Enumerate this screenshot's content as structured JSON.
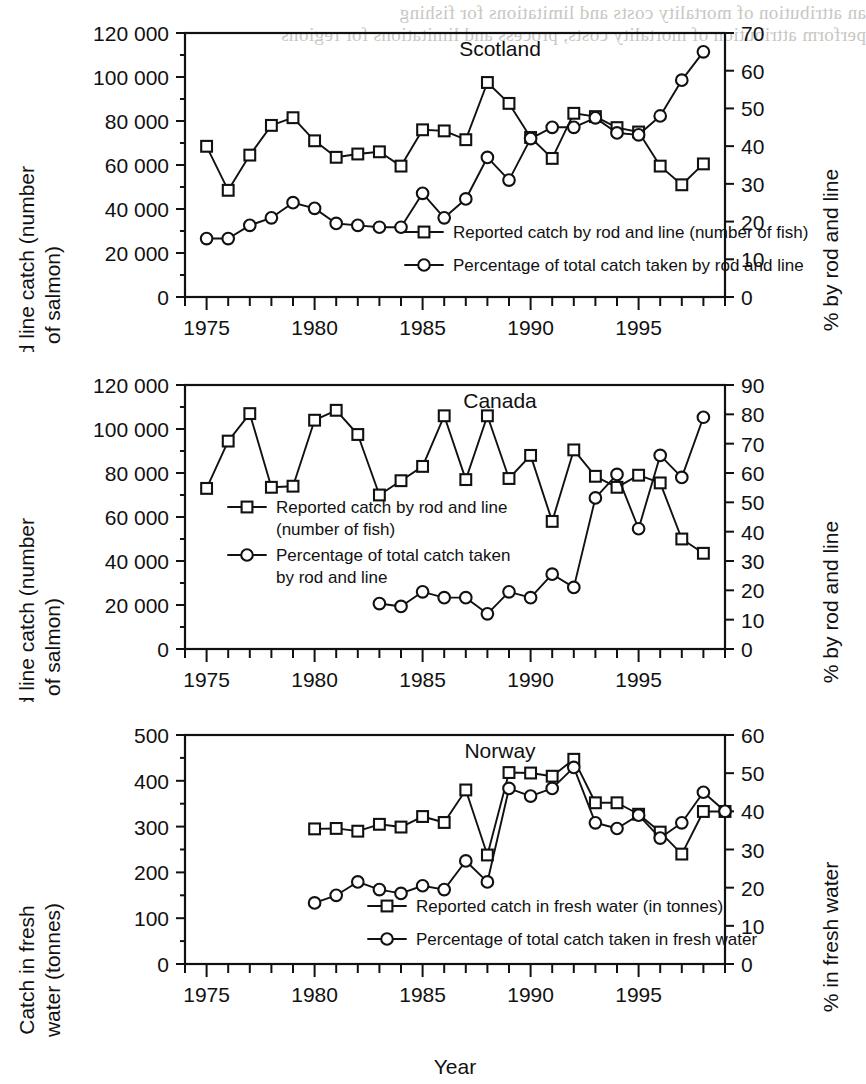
{
  "page": {
    "background_color": "#ffffff",
    "ink_color": "#111111",
    "showthrough_color": "#c9c6c2",
    "showthrough_lines": [
      "an attribution of mortality costs and limitations for fishing",
      "perform attribution of mortality costs, process and limitations for regions"
    ],
    "x_axis_title": "Year"
  },
  "chart_data": [
    {
      "id": "scotland",
      "type": "line",
      "title": "Scotland",
      "xlabel": "",
      "ylabel": "Rod and line catch (number of salmon)",
      "y2label": "% by rod and line",
      "xlim": [
        1974,
        1999
      ],
      "xticks": [
        1975,
        1980,
        1985,
        1990,
        1995
      ],
      "xtick_labels": [
        "1975",
        "1980",
        "1985",
        "1990",
        "1995"
      ],
      "ylim": [
        0,
        120000
      ],
      "yticks": [
        0,
        20000,
        40000,
        60000,
        80000,
        100000,
        120000
      ],
      "ytick_labels": [
        "0",
        "20 000",
        "40 000",
        "60 000",
        "80 000",
        "100 000",
        "120 000"
      ],
      "y2lim": [
        0,
        70
      ],
      "y2ticks": [
        0,
        10,
        20,
        30,
        40,
        50,
        60,
        70
      ],
      "y2tick_labels": [
        "0",
        "10",
        "20",
        "30",
        "40",
        "50",
        "60",
        "70"
      ],
      "grid": false,
      "legend_position": "lower-right-inside",
      "series": [
        {
          "name": "Reported catch by rod and line (number of fish)",
          "marker": "square",
          "axis": "left",
          "x": [
            1975,
            1976,
            1977,
            1978,
            1979,
            1980,
            1981,
            1982,
            1983,
            1984,
            1985,
            1986,
            1987,
            1988,
            1989,
            1990,
            1991,
            1992,
            1993,
            1994,
            1995,
            1996,
            1997,
            1998
          ],
          "values": [
            68500,
            48500,
            64500,
            78000,
            81500,
            71000,
            63500,
            65000,
            66000,
            59500,
            76000,
            75500,
            71500,
            97500,
            88000,
            72500,
            63000,
            83500,
            82000,
            77000,
            75000,
            59500,
            51000,
            60500
          ]
        },
        {
          "name": "Percentage of total catch taken by rod and line",
          "marker": "circle",
          "axis": "right",
          "x": [
            1975,
            1976,
            1977,
            1978,
            1979,
            1980,
            1981,
            1982,
            1983,
            1984,
            1985,
            1986,
            1987,
            1988,
            1989,
            1990,
            1991,
            1992,
            1993,
            1994,
            1995,
            1996,
            1997,
            1998
          ],
          "values": [
            15.5,
            15.5,
            19,
            21,
            25,
            23.5,
            19.5,
            19,
            18.5,
            18.5,
            27.5,
            21,
            26,
            37,
            31,
            42,
            45,
            45,
            47.5,
            43.5,
            43,
            48,
            57.5,
            65
          ]
        }
      ]
    },
    {
      "id": "canada",
      "type": "line",
      "title": "Canada",
      "xlabel": "",
      "ylabel": "Rod and line catch (number of salmon)",
      "y2label": "% by rod and line",
      "xlim": [
        1974,
        1999
      ],
      "xticks": [
        1975,
        1980,
        1985,
        1990,
        1995
      ],
      "xtick_labels": [
        "1975",
        "1980",
        "1985",
        "1990",
        "1995"
      ],
      "ylim": [
        0,
        120000
      ],
      "yticks": [
        0,
        20000,
        40000,
        60000,
        80000,
        100000,
        120000
      ],
      "ytick_labels": [
        "0",
        "20 000",
        "40 000",
        "60 000",
        "80 000",
        "100 000",
        "120 000"
      ],
      "y2lim": [
        0,
        90
      ],
      "y2ticks": [
        0,
        10,
        20,
        30,
        40,
        50,
        60,
        70,
        80,
        90
      ],
      "y2tick_labels": [
        "0",
        "10",
        "20",
        "30",
        "40",
        "50",
        "60",
        "70",
        "80",
        "90"
      ],
      "grid": false,
      "legend_position": "middle-left-inside",
      "series": [
        {
          "name": "Reported catch by rod and line (number of fish)",
          "marker": "square",
          "axis": "left",
          "x": [
            1975,
            1976,
            1977,
            1978,
            1979,
            1980,
            1981,
            1982,
            1983,
            1984,
            1985,
            1986,
            1987,
            1988,
            1989,
            1990,
            1991,
            1992,
            1993,
            1994,
            1995,
            1996,
            1997,
            1998
          ],
          "values": [
            73000,
            94500,
            107000,
            73500,
            74000,
            104000,
            108500,
            97500,
            70000,
            76500,
            83000,
            106000,
            77000,
            106000,
            77500,
            88000,
            58000,
            90500,
            78500,
            73500,
            79000,
            75500,
            50000,
            43500
          ]
        },
        {
          "name": "Percentage of total catch taken by rod and line",
          "marker": "circle",
          "axis": "right",
          "x": [
            1983,
            1984,
            1985,
            1986,
            1987,
            1988,
            1989,
            1990,
            1991,
            1992,
            1993,
            1994,
            1995,
            1996,
            1997,
            1998
          ],
          "values": [
            15.5,
            14.5,
            19.5,
            17.5,
            17.5,
            12,
            19.5,
            17.5,
            25.5,
            21,
            51.5,
            59.5,
            41,
            66,
            58.5,
            79,
            77
          ]
        }
      ]
    },
    {
      "id": "norway",
      "type": "line",
      "title": "Norway",
      "xlabel": "Year",
      "ylabel": "Catch in fresh water (tonnes)",
      "y2label": "% in fresh water",
      "xlim": [
        1974,
        1999
      ],
      "xticks": [
        1975,
        1980,
        1985,
        1990,
        1995
      ],
      "xtick_labels": [
        "1975",
        "1980",
        "1985",
        "1990",
        "1995"
      ],
      "ylim": [
        0,
        500
      ],
      "yticks": [
        0,
        100,
        200,
        300,
        400,
        500
      ],
      "ytick_labels": [
        "0",
        "100",
        "200",
        "300",
        "400",
        "500"
      ],
      "y2lim": [
        0,
        60
      ],
      "y2ticks": [
        0,
        10,
        20,
        30,
        40,
        50,
        60
      ],
      "y2tick_labels": [
        "0",
        "10",
        "20",
        "30",
        "40",
        "50",
        "60"
      ],
      "grid": false,
      "legend_position": "lower-center-inside",
      "series": [
        {
          "name": "Reported catch in fresh water (in tonnes)",
          "marker": "square",
          "axis": "left",
          "x": [
            1980,
            1981,
            1982,
            1983,
            1984,
            1985,
            1986,
            1987,
            1988,
            1989,
            1990,
            1991,
            1992,
            1993,
            1994,
            1995,
            1996,
            1997,
            1998,
            1999
          ],
          "values": [
            295,
            296,
            290,
            305,
            299,
            322,
            309,
            380,
            238,
            418,
            417,
            410,
            447,
            352,
            352,
            327,
            288,
            240,
            333,
            333
          ]
        },
        {
          "name": "Percentage of total catch taken in fresh water",
          "marker": "circle",
          "axis": "right",
          "x": [
            1980,
            1981,
            1982,
            1983,
            1984,
            1985,
            1986,
            1987,
            1988,
            1989,
            1990,
            1991,
            1992,
            1993,
            1994,
            1995,
            1996,
            1997,
            1998,
            1999
          ],
          "values": [
            16,
            18,
            21.5,
            19.5,
            18.5,
            20.5,
            19.5,
            27,
            21.5,
            46,
            44,
            46,
            51.5,
            37,
            35.5,
            39,
            33,
            37,
            45,
            40
          ]
        }
      ]
    }
  ]
}
